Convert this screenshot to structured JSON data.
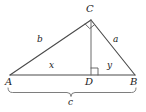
{
  "figure": {
    "kind": "geometry-diagram",
    "stroke_color": "#4a4a4a",
    "label_color": "#1c1c1c",
    "background": "#ffffff",
    "vertices": [
      {
        "id": "A",
        "label": "A",
        "x": 10,
        "y": 75,
        "label_x": 6,
        "label_y": 78
      },
      {
        "id": "B",
        "label": "B",
        "x": 135,
        "y": 75,
        "label_x": 131,
        "label_y": 78
      },
      {
        "id": "C",
        "label": "C",
        "x": 91,
        "y": 20,
        "label_x": 86,
        "label_y": 6
      },
      {
        "id": "D",
        "label": "D",
        "x": 91,
        "y": 75,
        "label_x": 86,
        "label_y": 78
      }
    ],
    "segments": [
      {
        "id": "AC",
        "from": "A",
        "to": "C",
        "label": "b",
        "label_x": 39,
        "label_y": 39
      },
      {
        "id": "CB",
        "from": "C",
        "to": "B",
        "label": "a",
        "label_x": 115,
        "label_y": 39
      },
      {
        "id": "AD",
        "from": "A",
        "to": "D",
        "label": "x",
        "label_x": 50,
        "label_y": 63
      },
      {
        "id": "DB",
        "from": "D",
        "to": "B",
        "label": "y",
        "label_x": 108,
        "label_y": 63
      },
      {
        "id": "CD",
        "from": "C",
        "to": "D",
        "label": "",
        "label_x": 0,
        "label_y": 0
      }
    ],
    "right_angles": [
      {
        "id": "angle-at-C",
        "at": "C",
        "size": 7
      },
      {
        "id": "angle-at-D",
        "at": "D",
        "size": 7
      }
    ],
    "brace": {
      "id": "brace-AB",
      "label": "c",
      "from_x": 8,
      "to_x": 136,
      "y": 90,
      "label_x": 68,
      "label_y": 97
    }
  }
}
